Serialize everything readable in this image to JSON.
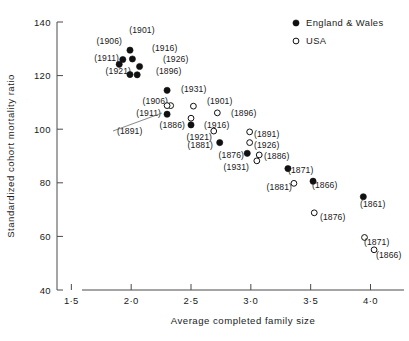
{
  "figure": {
    "background": "#ffffff",
    "ink": "#101010"
  },
  "chart_data": {
    "type": "scatter",
    "title": "",
    "xlabel": "Average completed family size",
    "ylabel": "Standardized cohort mortality ratio",
    "xlim": [
      1.38,
      4.28
    ],
    "ylim": [
      40,
      140
    ],
    "xticks": [
      1.5,
      2.0,
      2.5,
      3.0,
      3.5,
      4.0
    ],
    "xticklabels": [
      "1·5",
      "2·0",
      "2·5",
      "3·0",
      "3·5",
      "4·0"
    ],
    "yticks": [
      40,
      60,
      80,
      100,
      120,
      140
    ],
    "yticklabels": [
      "40",
      "60",
      "80",
      "100",
      "120",
      "140"
    ],
    "grid": false,
    "legend_position": "top-right",
    "legend": [
      {
        "label": "England & Wales",
        "marker": "filled-circle"
      },
      {
        "label": "USA",
        "marker": "open-circle"
      }
    ],
    "series": [
      {
        "name": "England & Wales",
        "marker": "filled-circle",
        "points": [
          {
            "label": "(1901)",
            "x": 1.99,
            "y": 129.5,
            "lx": 142,
            "ly": 33,
            "anchor": "middle"
          },
          {
            "label": "(1906)",
            "x": 1.93,
            "y": 126.0,
            "lx": 122,
            "ly": 44,
            "anchor": "end"
          },
          {
            "label": "(1916)",
            "x": 2.01,
            "y": 126.2,
            "lx": 152,
            "ly": 51,
            "anchor": "start"
          },
          {
            "label": "(1911)",
            "x": 1.9,
            "y": 124.2,
            "lx": 119,
            "ly": 61,
            "anchor": "end"
          },
          {
            "label": "(1926)",
            "x": 2.07,
            "y": 123.4,
            "lx": 163,
            "ly": 62,
            "anchor": "start"
          },
          {
            "label": "(1921)",
            "x": 1.99,
            "y": 120.4,
            "lx": 131,
            "ly": 74,
            "anchor": "end"
          },
          {
            "label": "(1896)",
            "x": 2.05,
            "y": 120.3,
            "lx": 156,
            "ly": 74,
            "anchor": "start"
          },
          {
            "label": "(1931)",
            "x": 2.3,
            "y": 114.5,
            "lx": 181,
            "ly": 92,
            "anchor": "start"
          },
          {
            "label": "(1911)",
            "x": 2.3,
            "y": 105.6,
            "lx": 161,
            "ly": 116,
            "anchor": "end"
          },
          {
            "label": "(1886)",
            "x": 2.5,
            "y": 101.6,
            "lx": 185,
            "ly": 128,
            "anchor": "end"
          },
          {
            "label": "(1881)",
            "x": 2.74,
            "y": 95.0,
            "lx": 213,
            "ly": 148,
            "anchor": "end"
          },
          {
            "label": "(1876)",
            "x": 2.97,
            "y": 91.0,
            "lx": 244,
            "ly": 158,
            "anchor": "end"
          },
          {
            "label": "(1871)",
            "x": 3.31,
            "y": 85.3,
            "lx": 288,
            "ly": 173,
            "anchor": "start"
          },
          {
            "label": "(1866)",
            "x": 3.52,
            "y": 80.6,
            "lx": 312,
            "ly": 188,
            "anchor": "start"
          },
          {
            "label": "(1861)",
            "x": 3.94,
            "y": 74.8,
            "lx": 360,
            "ly": 207,
            "anchor": "start"
          }
        ]
      },
      {
        "name": "USA",
        "marker": "open-circle",
        "points": [
          {
            "label": "(1906)",
            "x": 2.33,
            "y": 108.8,
            "lx": 168,
            "ly": 104,
            "anchor": "end"
          },
          {
            "label": "(1901)",
            "x": 2.52,
            "y": 108.6,
            "lx": 207,
            "ly": 104,
            "anchor": "start"
          },
          {
            "label": "(1896)",
            "x": 2.72,
            "y": 106.1,
            "lx": 231,
            "ly": 116,
            "anchor": "start"
          },
          {
            "label": "(1916)",
            "x": 2.5,
            "y": 104.1,
            "lx": 204,
            "ly": 128,
            "anchor": "start"
          },
          {
            "label": "(1921)",
            "x": 2.69,
            "y": 99.3,
            "lx": 212,
            "ly": 140,
            "anchor": "end"
          },
          {
            "label": "(1891)",
            "x": 2.99,
            "y": 99.0,
            "lx": 254,
            "ly": 137,
            "anchor": "start"
          },
          {
            "label": "(1926)",
            "x": 2.99,
            "y": 95.0,
            "lx": 254,
            "ly": 148,
            "anchor": "start"
          },
          {
            "label": "(1886)",
            "x": 3.07,
            "y": 90.4,
            "lx": 264,
            "ly": 159,
            "anchor": "start"
          },
          {
            "label": "(1931)",
            "x": 3.05,
            "y": 88.2,
            "lx": 249,
            "ly": 170,
            "anchor": "end"
          },
          {
            "label": "(1881)",
            "x": 3.36,
            "y": 79.8,
            "lx": 292,
            "ly": 190,
            "anchor": "end"
          },
          {
            "label": "(1876)",
            "x": 3.53,
            "y": 68.8,
            "lx": 320,
            "ly": 220,
            "anchor": "start"
          },
          {
            "label": "(1871)",
            "x": 3.95,
            "y": 59.6,
            "lx": 364,
            "ly": 245,
            "anchor": "start"
          },
          {
            "label": "(1866)",
            "x": 4.03,
            "y": 55.0,
            "lx": 376,
            "ly": 258,
            "anchor": "start"
          },
          {
            "label": "(1891)",
            "x": 2.3,
            "y": 108.8,
            "lx": 117,
            "ly": 134,
            "anchor": "start",
            "leader": true,
            "leader_from": [
              113,
              131
            ],
            "leader_to": [
              162,
              113
            ]
          }
        ]
      }
    ]
  }
}
